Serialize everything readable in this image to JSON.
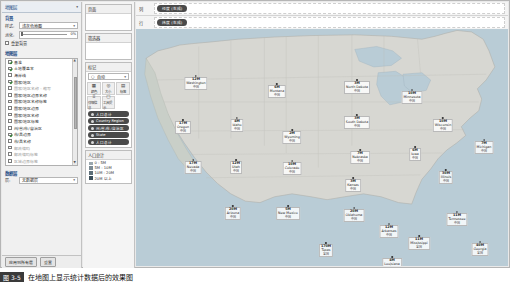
{
  "sidebar": {
    "title": "地图层",
    "collapse_icon": "chevron-down-icon",
    "background_group": "背景",
    "style_label": "样式:",
    "style_value": "浅灰色地图",
    "washout_label": "淡化:",
    "washout_value": "0%",
    "repeat_bg_label": "重复背景",
    "layers_group": "地图层",
    "layers": [
      {
        "label": "基准",
        "checked": true,
        "dim": false
      },
      {
        "label": "土地覆盖率",
        "checked": true,
        "dim": false
      },
      {
        "label": "海岸线",
        "checked": false,
        "dim": false
      },
      {
        "label": "国家/地区",
        "checked": true,
        "dim": false
      },
      {
        "label": "国家/地区名称 - 缩写",
        "checked": false,
        "dim": true
      },
      {
        "label": "国家/地区边界名称",
        "checked": false,
        "dim": false
      },
      {
        "label": "国家/地区名称标签",
        "checked": false,
        "dim": false
      },
      {
        "label": "国家/地区边界",
        "checked": false,
        "dim": false
      },
      {
        "label": "国家/地区名称",
        "checked": false,
        "dim": false
      },
      {
        "label": "国家/地区标签",
        "checked": false,
        "dim": false
      },
      {
        "label": "州/省/市/自治区",
        "checked": false,
        "dim": false
      },
      {
        "label": "市/县边界",
        "checked": true,
        "dim": false
      },
      {
        "label": "市/县名称",
        "checked": false,
        "dim": false
      },
      {
        "label": "邮政编码",
        "checked": false,
        "dim": true
      },
      {
        "label": "邮政编码标签",
        "checked": false,
        "dim": true
      },
      {
        "label": "区域边界标签",
        "checked": false,
        "dim": true
      },
      {
        "label": "区域及区域标签",
        "checked": false,
        "dim": true
      },
      {
        "label": "街道和公路标签",
        "checked": false,
        "dim": true
      }
    ],
    "data_layer_group": "数据层",
    "data_layer_label": "层:",
    "data_layer_value": "无数据层",
    "footer": {
      "apply": "应用到所有层",
      "reset": "重置"
    }
  },
  "middle": {
    "pages_title": "页面",
    "filters_title": "筛选器",
    "marks_title": "标记",
    "marks_type": "自动",
    "marks_type_icon": "chevron-down-icon",
    "mark_buttons": [
      {
        "icon": "color-icon",
        "glyph": "▦",
        "name": "颜色"
      },
      {
        "icon": "size-icon",
        "glyph": "◎",
        "name": "大小"
      },
      {
        "icon": "label-icon",
        "glyph": "▤",
        "name": "标签"
      },
      {
        "icon": "detail-icon",
        "glyph": "⠿",
        "name": "详细信息"
      },
      {
        "icon": "tooltip-icon",
        "glyph": "▢",
        "name": "工具提示"
      }
    ],
    "mark_pills": [
      {
        "icon": "color-pill-icon",
        "label": "人口总计"
      },
      {
        "icon": "geo-pill-icon",
        "label": "Country Region"
      },
      {
        "icon": "geo-pill-icon",
        "label": "州/省/市/自治区"
      },
      {
        "icon": "text-pill-icon",
        "label": "State"
      },
      {
        "icon": "text-pill-icon",
        "label": "人口总计"
      }
    ],
    "legend_title": "人口总计",
    "legend_items": [
      "0 - 5M",
      "5M - 10M",
      "10M - 20M",
      "20M 以上"
    ]
  },
  "shelves": [
    {
      "caption": "列",
      "icon": "columns-icon",
      "pill": "经度 (生成)"
    },
    {
      "caption": "行",
      "icon": "rows-icon",
      "pill": "纬度 (生成)"
    }
  ],
  "colors": {
    "water": "#b9ccd6",
    "land": "#d7d7d2",
    "accent": "#1e4d86",
    "pill": "#4a4a4a"
  },
  "chart_data": {
    "type": "map",
    "title": "人口总计",
    "region": "United States",
    "value_unit": "M",
    "sub_label": "中国",
    "points": [
      {
        "state": "Washington",
        "value": "12M",
        "cn": "中国",
        "x": 60,
        "y": 46
      },
      {
        "state": "Oregon",
        "value": "17M",
        "cn": "中国",
        "x": 47,
        "y": 90
      },
      {
        "state": "Montana",
        "value": "6M",
        "cn": "中国",
        "x": 141,
        "y": 54
      },
      {
        "state": "Idaho",
        "value": "4M",
        "cn": "中国",
        "x": 101,
        "y": 88
      },
      {
        "state": "Wyoming",
        "value": "2M",
        "cn": "中国",
        "x": 156,
        "y": 100
      },
      {
        "state": "North Dakota",
        "value": "3M",
        "cn": "中国",
        "x": 221,
        "y": 50
      },
      {
        "state": "South Dakota",
        "value": "3M",
        "cn": "中国",
        "x": 221,
        "y": 85
      },
      {
        "state": "Nebraska",
        "value": "7M",
        "cn": "中国",
        "x": 224,
        "y": 120
      },
      {
        "state": "Minnesota",
        "value": "10M",
        "cn": "中国",
        "x": 276,
        "y": 60
      },
      {
        "state": "Wisconsin",
        "value": "10M",
        "cn": "中国",
        "x": 307,
        "y": 88
      },
      {
        "state": "Michigan",
        "value": "7M",
        "cn": "中国",
        "x": 348,
        "y": 110
      },
      {
        "state": "Iowa",
        "value": "6M",
        "cn": "中国",
        "x": 279,
        "y": 117
      },
      {
        "state": "Illinois",
        "value": "30M",
        "cn": "中国",
        "x": 310,
        "y": 140
      },
      {
        "state": "Nevada",
        "value": "17M",
        "cn": "中国",
        "x": 57,
        "y": 130
      },
      {
        "state": "Utah",
        "value": "12M",
        "cn": "中国",
        "x": 100,
        "y": 130
      },
      {
        "state": "Colorado",
        "value": "10M",
        "cn": "中国",
        "x": 156,
        "y": 131
      },
      {
        "state": "Kansas",
        "value": "3M",
        "cn": "中国",
        "x": 217,
        "y": 148
      },
      {
        "state": "Arizona",
        "value": "20M",
        "cn": "中国",
        "x": 97,
        "y": 176
      },
      {
        "state": "New Mexico",
        "value": "5M",
        "cn": "中国",
        "x": 152,
        "y": 176
      },
      {
        "state": "Oklahoma",
        "value": "20M",
        "cn": "中国",
        "x": 218,
        "y": 178
      },
      {
        "state": "Texas",
        "value": "170M",
        "cn": "全国",
        "x": 190,
        "y": 213
      },
      {
        "state": "Arkansas",
        "value": "12M",
        "cn": "中国",
        "x": 253,
        "y": 194
      },
      {
        "state": "Mississippi",
        "value": "11M",
        "cn": "全国",
        "x": 283,
        "y": 206
      },
      {
        "state": "Louisiana",
        "value": "4M",
        "cn": "全国",
        "x": 256,
        "y": 227
      },
      {
        "state": "Tennessee",
        "value": "11M",
        "cn": "中国",
        "x": 321,
        "y": 182
      },
      {
        "state": "Georgia",
        "value": "40M",
        "cn": "全国",
        "x": 344,
        "y": 212
      },
      {
        "state": "Florida",
        "value": "30M",
        "cn": "全国",
        "x": 373,
        "y": 246
      },
      {
        "state": "North Carolina",
        "value": "9M",
        "cn": "中国",
        "x": 381,
        "y": 180
      },
      {
        "state": "New York",
        "value": "32M",
        "cn": "全国",
        "x": 425,
        "y": 117
      },
      {
        "state": "Pennsylvania",
        "value": "11M",
        "cn": "全国",
        "x": 413,
        "y": 140
      },
      {
        "state": "Rhode Island",
        "value": "23M",
        "cn": "全国",
        "x": 462,
        "y": 136
      },
      {
        "state": "Maine",
        "value": "3M",
        "cn": "全国",
        "x": 458,
        "y": 96
      },
      {
        "state": "West Virginia",
        "value": "3M",
        "cn": "全国",
        "x": 398,
        "y": 162
      },
      {
        "state": "Delaware",
        "value": "27M",
        "cn": "全国",
        "x": 439,
        "y": 162
      }
    ]
  },
  "caption": {
    "number": "图 3-5",
    "text": "在地图上显示统计数据后的效果图"
  }
}
